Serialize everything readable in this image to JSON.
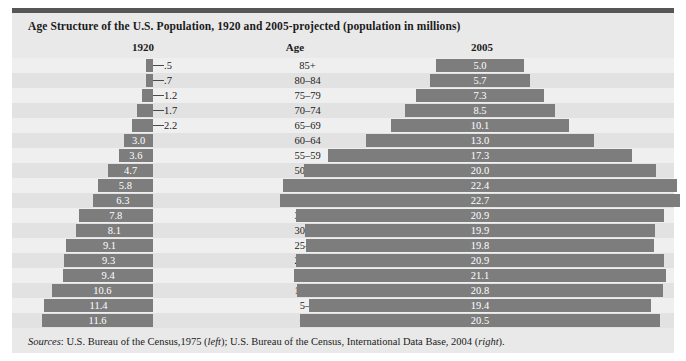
{
  "figure": {
    "title": "Age Structure of the U.S. Population, 1920 and 2005-projected (population in millions)",
    "headers": {
      "left": "1920",
      "center": "Age",
      "right": "2005"
    },
    "sources_prefix": "Sources",
    "sources_text": ": U.S. Bureau of the Census,1975 (left); U.S. Bureau of the Census, International Data Base, 2004 (right).",
    "sources_left_note": "left",
    "sources_right_note": "right",
    "colors": {
      "bar": "#7d7d7d",
      "panel": "#e9e9e9",
      "row_even": "#e2e2e2",
      "row_odd": "#efefef",
      "rule": "#565656",
      "label_light": "#ffffff",
      "label_dark": "#1b1b1b"
    }
  },
  "chart_data": {
    "type": "bar",
    "title": "Age Structure of the U.S. Population, 1920 and 2005-projected (population in millions)",
    "subtype": "population-pyramid",
    "xlabel": "Population (millions)",
    "ylabel": "Age",
    "categories": [
      "85+",
      "80–84",
      "75–79",
      "70–74",
      "65–69",
      "60–64",
      "55–59",
      "50–54",
      "45–49",
      "40–44",
      "35–39",
      "30–34",
      "25–29",
      "20–24",
      "15–19",
      "10–14",
      "5–9",
      "0–4"
    ],
    "series": [
      {
        "name": "1920",
        "side": "left",
        "values": [
          0.5,
          0.7,
          1.2,
          1.7,
          2.2,
          3.0,
          3.6,
          4.7,
          5.8,
          6.3,
          7.8,
          8.1,
          9.1,
          9.3,
          9.4,
          10.6,
          11.4,
          11.6
        ],
        "labels": [
          ".5",
          ".7",
          "1.2",
          "1.7",
          "2.2",
          "3.0",
          "3.6",
          "4.7",
          "5.8",
          "6.3",
          "7.8",
          "8.1",
          "9.1",
          "9.3",
          "9.4",
          "10.6",
          "11.4",
          "11.6"
        ]
      },
      {
        "name": "2005",
        "side": "right",
        "values": [
          5.0,
          5.7,
          7.3,
          8.5,
          10.1,
          13.0,
          17.3,
          20.0,
          22.4,
          22.7,
          20.9,
          19.9,
          19.8,
          20.9,
          21.1,
          20.8,
          19.4,
          20.5
        ],
        "labels": [
          "5.0",
          "5.7",
          "7.3",
          "8.5",
          "10.1",
          "13.0",
          "17.3",
          "20.0",
          "22.4",
          "22.7",
          "20.9",
          "19.9",
          "19.8",
          "20.9",
          "21.1",
          "20.8",
          "19.4",
          "20.5"
        ]
      }
    ],
    "grid": false,
    "legend": "none",
    "xlim_left": [
      0,
      12
    ],
    "xlim_right": [
      0,
      23
    ]
  }
}
